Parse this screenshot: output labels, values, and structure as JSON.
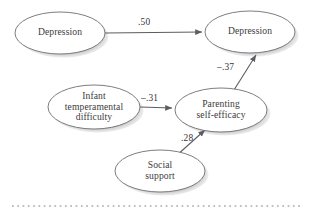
{
  "figure": {
    "type": "path-diagram",
    "background_color": "#ffffff",
    "node_fill_color": "#ffffff",
    "node_stroke_color": "#6e6e72",
    "node_shadow_color": "#8a8a8e",
    "text_color": "#3c3c3c",
    "edge_color": "#5d5d62",
    "rule_color": "#a9a9ad"
  },
  "nodes": [
    {
      "id": "depression-t1",
      "label": "Depression",
      "shape": "ellipse",
      "cx": 60,
      "cy": 33,
      "rx": 45,
      "ry": 21
    },
    {
      "id": "depression-t2",
      "label": "Depression",
      "shape": "ellipse",
      "cx": 250,
      "cy": 32,
      "rx": 45,
      "ry": 21
    },
    {
      "id": "infant-temperamental-difficulty",
      "label": "Infant\ntemperamental\ndifficulty",
      "shape": "ellipse",
      "cx": 94,
      "cy": 107,
      "rx": 46,
      "ry": 22
    },
    {
      "id": "parenting-self-efficacy",
      "label": "Parenting\nself-efficacy",
      "shape": "ellipse",
      "cx": 221,
      "cy": 110,
      "rx": 46,
      "ry": 22
    },
    {
      "id": "social-support",
      "label": "Social\nsupport",
      "shape": "ellipse",
      "cx": 160,
      "cy": 171,
      "rx": 45,
      "ry": 21
    }
  ],
  "edges": [
    {
      "id": "edge-depression-to-depression",
      "from": "depression-t1",
      "to": "depression-t2",
      "coefficient": ".50",
      "label_x": 138,
      "label_y": 17
    },
    {
      "id": "edge-parenting-to-depression",
      "from": "parenting-self-efficacy",
      "to": "depression-t2",
      "coefficient": "–.37",
      "label_x": 217,
      "label_y": 62
    },
    {
      "id": "edge-infant-to-parenting",
      "from": "infant-temperamental-difficulty",
      "to": "parenting-self-efficacy",
      "coefficient": "–.31",
      "label_x": 141,
      "label_y": 93
    },
    {
      "id": "edge-social-to-parenting",
      "from": "social-support",
      "to": "parenting-self-efficacy",
      "coefficient": ".28",
      "label_x": 181,
      "label_y": 133
    }
  ],
  "footer_rule": {
    "id": "dotted-rule",
    "style": "dotted",
    "y": 206,
    "x_start": 12,
    "x_end": 302
  }
}
